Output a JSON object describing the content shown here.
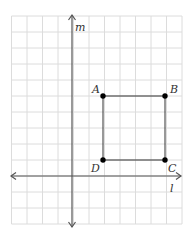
{
  "diagram": {
    "axes": {
      "horizontal_label": "l",
      "vertical_label": "m"
    },
    "points": [
      {
        "name": "A",
        "col": 2,
        "row": 4
      },
      {
        "name": "B",
        "col": 6,
        "row": 4
      },
      {
        "name": "C",
        "col": 6,
        "row": 0
      },
      {
        "name": "D",
        "col": 2,
        "row": 0
      }
    ],
    "shape": "square ABCD",
    "colors": {
      "grid": "#dcdcdc",
      "axis": "#555555",
      "shape": "#333333",
      "point": "#000000"
    }
  }
}
